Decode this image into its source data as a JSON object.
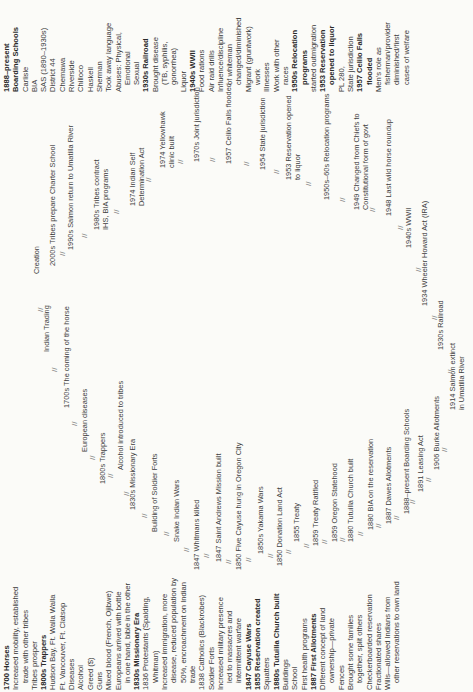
{
  "left_column": [
    {
      "text": "1700 Horses",
      "bold": true
    },
    {
      "text": "Increased mobility, established"
    },
    {
      "text": "trade with other tribes",
      "indent": true
    },
    {
      "text": "Tribes prosper"
    },
    {
      "text": "1800s Trappers",
      "bold": true
    },
    {
      "text": "Hudson Bay, Ft. Walla Walla"
    },
    {
      "text": "Ft. Vancouver, Ft. Clatsop"
    },
    {
      "text": "Diseases"
    },
    {
      "text": "Alcohol"
    },
    {
      "text": "Greed ($)"
    },
    {
      "text": "Guns"
    },
    {
      "text": "Mixed blood (French, Ojibwe)"
    },
    {
      "text": "Europeans arrived with bottle"
    },
    {
      "text": "in one hand, bible in the other",
      "indent": true
    },
    {
      "text": "1830s Missionary Era",
      "bold": true
    },
    {
      "text": "1836 Protestants (Spalding,"
    },
    {
      "text": "Whitman)",
      "indent": true
    },
    {
      "text": "Increased immigration, more"
    },
    {
      "text": "disease, reduced population by",
      "indent": true
    },
    {
      "text": "50%, encroachment on Indian",
      "indent": true
    },
    {
      "text": "trade",
      "indent": true
    },
    {
      "text": "1838 Catholics (Blackrobes)"
    },
    {
      "text": "Soldier Forts"
    },
    {
      "text": "Increased military presence"
    },
    {
      "text": "led to massacres and",
      "indent": true
    },
    {
      "text": "intermittent warfare",
      "indent": true
    },
    {
      "text": "1847 Cayuse Wars",
      "bold": true
    },
    {
      "text": "1855 Reservation created",
      "bold": true
    },
    {
      "text": "Squatters"
    },
    {
      "text": "1880s Tutuilla Church built",
      "bold": true
    },
    {
      "text": "Buildings"
    },
    {
      "text": "School"
    },
    {
      "text": "First health programs"
    },
    {
      "text": "1887 First Allotments",
      "bold": true
    },
    {
      "text": "Different concept of land"
    },
    {
      "text": "ownership—private",
      "indent": true
    },
    {
      "text": "Fences"
    },
    {
      "text": "Brought some families"
    },
    {
      "text": "together, split others",
      "indent": true
    },
    {
      "text": "Checkerboarded reservation"
    },
    {
      "text": "Fractionated shares"
    },
    {
      "text": "Wills—allowed Indians from"
    },
    {
      "text": "other reservations to own land",
      "indent": true
    }
  ],
  "right_column": [
    {
      "text": "1888–present",
      "bold": true
    },
    {
      "text": "Boarding Schools",
      "bold": true
    },
    {
      "text": "Carlisle"
    },
    {
      "text": "BIA"
    },
    {
      "text": "SAS (1890–1930s)"
    },
    {
      "text": "District 44"
    },
    {
      "text": "Chemawa"
    },
    {
      "text": "Riverside"
    },
    {
      "text": "Chilloco"
    },
    {
      "text": "Haskell"
    },
    {
      "text": "Sherman"
    },
    {
      "text": "Took away language"
    },
    {
      "text": "Abuses: Physical,"
    },
    {
      "text": "Emotional",
      "indent": true
    },
    {
      "text": "Sexual",
      "indent": true
    },
    {
      "text": "1930s Railroad",
      "bold": true
    },
    {
      "text": "Brought disease"
    },
    {
      "text": "(TB, syphilis,",
      "indent": true
    },
    {
      "text": "gonorrhea)",
      "indent": true
    },
    {
      "text": "Liquor"
    },
    {
      "text": "1940s WWII",
      "bold": true
    },
    {
      "text": "Food rations"
    },
    {
      "text": "Air raid drills"
    },
    {
      "text": "Influence/discipline"
    },
    {
      "text": "of whiteman",
      "indent": true
    },
    {
      "text": "changed/diminished",
      "indent": true
    },
    {
      "text": "Migrant (gruntwork)"
    },
    {
      "text": "work",
      "indent": true
    },
    {
      "text": "Illnesses"
    },
    {
      "text": "Work with other"
    },
    {
      "text": "races",
      "indent": true
    },
    {
      "text": "1950s Relocation",
      "bold": true
    },
    {
      "text": "programs",
      "bold": true,
      "indent": true
    },
    {
      "text": "started outmigration"
    },
    {
      "text": "1953 Reservation",
      "bold": true
    },
    {
      "text": "opened to liquor",
      "bold": true,
      "indent": true
    },
    {
      "text": "PL 280,"
    },
    {
      "text": "State jurisdiction"
    },
    {
      "text": "1957 Celilo Falls",
      "bold": true
    },
    {
      "text": "flooded",
      "bold": true,
      "indent": true
    },
    {
      "text": "Men's role as"
    },
    {
      "text": "fisherman/provider",
      "indent": true
    },
    {
      "text": "diminished/first",
      "indent": true
    },
    {
      "text": "cases of welfare",
      "indent": true
    }
  ],
  "ring": [
    {
      "id": "creation",
      "lines": [
        "Creation"
      ]
    },
    {
      "id": "indian-trading",
      "lines": [
        "Indian Trading"
      ]
    },
    {
      "id": "1700s-horse",
      "lines": [
        "1700s The coming of the horse"
      ]
    },
    {
      "id": "european-diseases",
      "lines": [
        "European diseases"
      ]
    },
    {
      "id": "1800s-trappers",
      "lines": [
        "1800s Trappers"
      ]
    },
    {
      "id": "alcohol",
      "lines": [
        "Alcohol introduced to tribes"
      ]
    },
    {
      "id": "1830s-missionary",
      "lines": [
        "1830s Missionary Era"
      ]
    },
    {
      "id": "soldier-forts",
      "lines": [
        "Building of Soldier Forts"
      ]
    },
    {
      "id": "snake-wars",
      "lines": [
        "Snake Indian Wars"
      ]
    },
    {
      "id": "1847-whitmans",
      "lines": [
        "1847 Whitmans killed"
      ]
    },
    {
      "id": "1847-mission",
      "lines": [
        "1847 Saint Andrews Mission built"
      ]
    },
    {
      "id": "1850-cayuse",
      "lines": [
        "1850 Five Cayuse hung in Oregon City"
      ]
    },
    {
      "id": "1850s-yakama",
      "lines": [
        "1850s Yakama Wars"
      ]
    },
    {
      "id": "1850-donation",
      "lines": [
        "1850 Donation Land Act"
      ]
    },
    {
      "id": "1855-treaty",
      "lines": [
        "1855 Treaty"
      ]
    },
    {
      "id": "1859-ratified",
      "lines": [
        "1859 Treaty Ratified"
      ]
    },
    {
      "id": "1859-statehood",
      "lines": [
        "1859 Oregon Statehood"
      ]
    },
    {
      "id": "1880-church",
      "lines": [
        "1880 Tutuilla Church built"
      ]
    },
    {
      "id": "1880-bia",
      "lines": [
        "1880 BIA on the reservation"
      ]
    },
    {
      "id": "1887-dawes",
      "lines": [
        "1887 Dawes Allotments"
      ]
    },
    {
      "id": "1888-boarding",
      "lines": [
        "1888–present Boarding Schools"
      ]
    },
    {
      "id": "1891-leasing",
      "lines": [
        "1891 Leasing Act"
      ]
    },
    {
      "id": "1906-burke",
      "lines": [
        "1906 Burke Allotments"
      ]
    },
    {
      "id": "1914-salmon",
      "lines": [
        "1914 Salmon extinct",
        "in Umatilla River"
      ]
    },
    {
      "id": "1930s-railroad",
      "lines": [
        "1930s Railroad"
      ]
    },
    {
      "id": "1934-ira",
      "lines": [
        "1934 Wheeler Howard Act (IRA)"
      ]
    },
    {
      "id": "1940s-wwii",
      "lines": [
        "1940s WWII"
      ]
    },
    {
      "id": "1948-horse",
      "lines": [
        "1948 Last wild horse roundup"
      ]
    },
    {
      "id": "1949-govt",
      "lines": [
        "1949 Changed from Chiefs to",
        "Constitutional form of govt"
      ]
    },
    {
      "id": "1950s-relocation",
      "lines": [
        "1950s–60s Relocation programs"
      ]
    },
    {
      "id": "1953-liquor",
      "lines": [
        "1953 Reservation opened",
        "to liquor"
      ]
    },
    {
      "id": "1954-state",
      "lines": [
        "1954 State jurisdiction"
      ]
    },
    {
      "id": "1957-celilo",
      "lines": [
        "1957 Celilo Falls flooded"
      ]
    },
    {
      "id": "1970s-joint",
      "lines": [
        "1970s Joint jurisdiction"
      ]
    },
    {
      "id": "1974-yellowhawk",
      "lines": [
        "1974 Yellowhawk",
        "clinic built"
      ]
    },
    {
      "id": "1974-selfdet",
      "lines": [
        "1974 Indian Self",
        "Determination Act"
      ]
    },
    {
      "id": "1980s-contract",
      "lines": [
        "1980s Tribes contract",
        "IHS, BIA programs"
      ]
    },
    {
      "id": "1990s-salmon",
      "lines": [
        "1990s Salmon return to Umatilla River"
      ]
    },
    {
      "id": "2000s-charter",
      "lines": [
        "2000s Tribes prepare Charter School"
      ]
    }
  ],
  "separator_glyph": "//"
}
